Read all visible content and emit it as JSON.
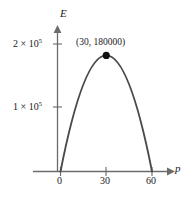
{
  "chart_data": {
    "type": "line",
    "title": "",
    "xlabel": "p",
    "ylabel": "E",
    "xlim": [
      -6,
      73
    ],
    "ylim": [
      0,
      230000
    ],
    "grid": false,
    "legend": null,
    "curve": {
      "name": "E(p)",
      "shape": "downward parabola",
      "roots": [
        0,
        60
      ],
      "vertex": {
        "x": 30,
        "y": 180000
      },
      "equation": "E = 200 p (60 - p)",
      "x": [
        0,
        5,
        10,
        15,
        20,
        25,
        30,
        35,
        40,
        45,
        50,
        55,
        60
      ],
      "y": [
        0,
        55000,
        100000,
        135000,
        160000,
        175000,
        180000,
        175000,
        160000,
        135000,
        100000,
        55000,
        0
      ]
    },
    "xticks": [
      {
        "value": 0,
        "label": "0"
      },
      {
        "value": 30,
        "label": "30"
      },
      {
        "value": 60,
        "label": "60"
      }
    ],
    "yticks": [
      {
        "value": 100000,
        "label": "1 × 10",
        "exponent": "5"
      },
      {
        "value": 200000,
        "label": "2 × 10",
        "exponent": "5"
      }
    ],
    "annotations": [
      {
        "text": "(30, 180000)",
        "x": 30,
        "y": 180000,
        "marker": "filled-circle"
      }
    ],
    "colors": {
      "curve": "#4a4a4a",
      "axis": "#6b6b6b",
      "text": "#1a1a1a",
      "marker": "#111111",
      "background": "#ffffff"
    }
  },
  "axes": {
    "y_name": "E",
    "x_name": "p"
  },
  "ticks": {
    "y_200000_mantissa": "2 × 10",
    "y_200000_exponent": "5",
    "y_100000_mantissa": "1 × 10",
    "y_100000_exponent": "5",
    "x_0": "0",
    "x_30": "30",
    "x_60": "60"
  },
  "annotation": {
    "vertex_text": "(30, 180000)"
  }
}
